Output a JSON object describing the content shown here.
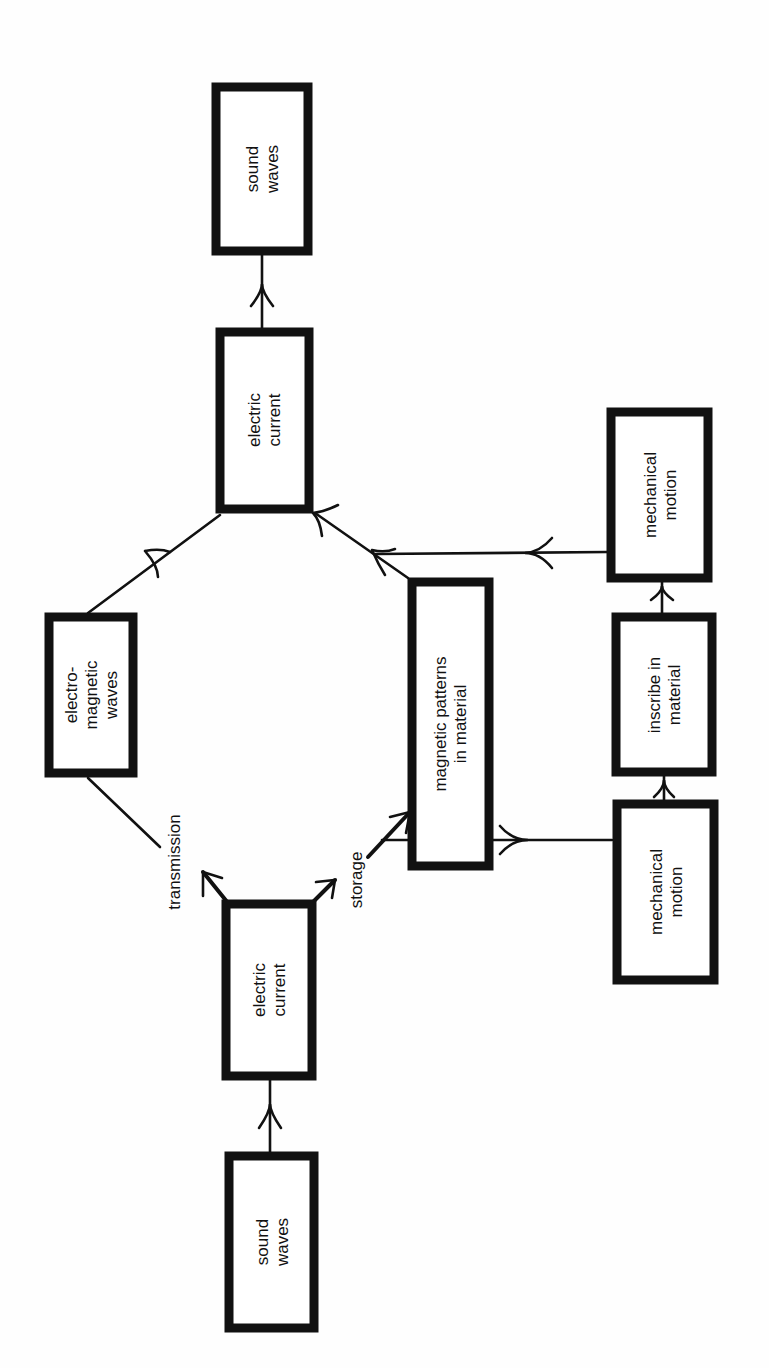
{
  "diagram": {
    "orientation": "rotated-90-ccw",
    "nodes": {
      "sound_waves_out": {
        "line1": "sound",
        "line2": "waves"
      },
      "electric_current_out": {
        "line1": "electric",
        "line2": "current"
      },
      "em_waves": {
        "line1": "electro-",
        "line2": "magnetic",
        "line3": "waves"
      },
      "magnetic_patterns": {
        "line1": "magnetic patterns",
        "line2": "in material"
      },
      "mechanical_motion_out": {
        "line1": "mechanical",
        "line2": "motion"
      },
      "inscribe": {
        "line1": "inscribe in",
        "line2": "material"
      },
      "mechanical_motion_in": {
        "line1": "mechanical",
        "line2": "motion"
      },
      "electric_current_in": {
        "line1": "electric",
        "line2": "current"
      },
      "sound_waves_in": {
        "line1": "sound",
        "line2": "waves"
      }
    },
    "edge_labels": {
      "transmission": "transmission",
      "storage": "storage"
    },
    "edges": [
      {
        "from": "sound_waves_in",
        "to": "electric_current_in"
      },
      {
        "from": "electric_current_in",
        "to": "em_waves",
        "label": "transmission"
      },
      {
        "from": "em_waves",
        "to": "electric_current_out"
      },
      {
        "from": "electric_current_in",
        "to": "magnetic_patterns",
        "label": "storage"
      },
      {
        "from": "magnetic_patterns",
        "to": "electric_current_out"
      },
      {
        "from": "electric_current_in",
        "to": "mechanical_motion_in",
        "label": "storage"
      },
      {
        "from": "mechanical_motion_in",
        "to": "inscribe"
      },
      {
        "from": "inscribe",
        "to": "mechanical_motion_out"
      },
      {
        "from": "mechanical_motion_out",
        "to": "electric_current_out"
      },
      {
        "from": "electric_current_out",
        "to": "sound_waves_out"
      }
    ]
  }
}
